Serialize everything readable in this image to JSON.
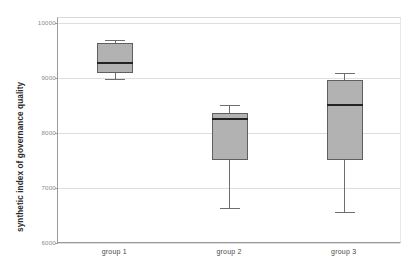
{
  "chart_data": {
    "type": "box",
    "title": "",
    "xlabel": "",
    "ylabel": "synthetic index of governance quality",
    "ylim": [
      6000,
      10000
    ],
    "yticks": [
      6000,
      7000,
      8000,
      9000,
      10000
    ],
    "ytick_labels": [
      "6000",
      "7000",
      "8000",
      "9000",
      "10000"
    ],
    "categories": [
      "group 1",
      "group 2",
      "group 3"
    ],
    "grid": true,
    "legend": "none",
    "boxes": [
      {
        "category": "group 1",
        "whisker_low": 8986,
        "q1": 9095,
        "median": 9276,
        "q3": 9638,
        "whisker_high": 9692
      },
      {
        "category": "group 2",
        "whisker_low": 6633,
        "q1": 7502,
        "median": 8263,
        "q3": 8371,
        "whisker_high": 8516
      },
      {
        "category": "group 3",
        "whisker_low": 6561,
        "q1": 7502,
        "median": 8516,
        "q3": 8968,
        "whisker_high": 9095
      }
    ]
  },
  "style": {
    "box_fill": "#b2b2b2",
    "box_edge": "#5f5f5f",
    "median_color": "#232323",
    "whisker_color": "#6e6e6e",
    "grid_color": "#dedede",
    "axis_color": "#9a9a9a",
    "tick_text_color": "#8a8a8a",
    "axis_title_color": "#2b2b2b"
  }
}
